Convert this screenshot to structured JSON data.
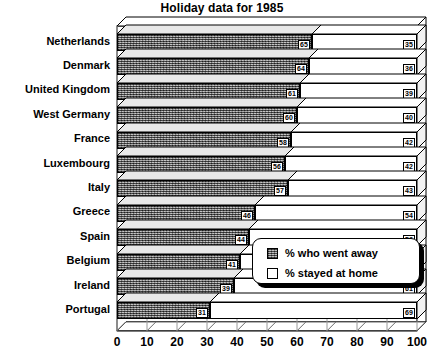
{
  "chart_data": {
    "type": "bar",
    "orientation": "horizontal",
    "stacked": true,
    "style": "3d",
    "title": "Holiday data for 1985",
    "xlabel": "",
    "ylabel": "",
    "xlim": [
      0,
      100
    ],
    "xticks": [
      "0",
      "10",
      "20",
      "30",
      "40",
      "50",
      "60",
      "70",
      "80",
      "90",
      "100"
    ],
    "grid": true,
    "legend_position": "center-right-inside",
    "categories": [
      "Netherlands",
      "Denmark",
      "United Kingdom",
      "West Germany",
      "France",
      "Luxembourg",
      "Italy",
      "Greece",
      "Spain",
      "Belgium",
      "Ireland",
      "Portugal"
    ],
    "series": [
      {
        "name": "% who went away",
        "values": [
          65,
          64,
          61,
          60,
          58,
          56,
          57,
          46,
          44,
          41,
          39,
          31
        ]
      },
      {
        "name": "% stayed at home",
        "values": [
          35,
          36,
          39,
          40,
          42,
          42,
          43,
          54,
          56,
          59,
          61,
          69
        ]
      }
    ]
  },
  "legend": {
    "items": [
      {
        "label": "% who went away",
        "swatch": "hatched-gray"
      },
      {
        "label": "% stayed at home",
        "swatch": "white"
      }
    ]
  },
  "colors": {
    "away_fill": "#8a8a8a",
    "home_fill": "#ffffff",
    "outline": "#000000",
    "background": "#ffffff"
  }
}
